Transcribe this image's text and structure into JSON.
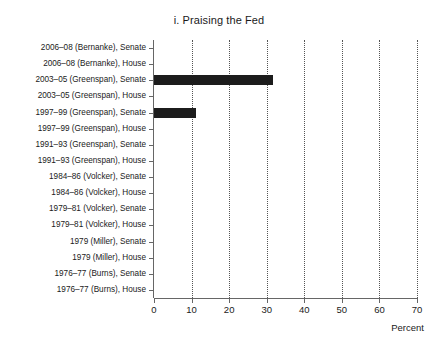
{
  "chart_data": {
    "type": "bar",
    "orientation": "horizontal",
    "title": "i. Praising the Fed",
    "xlabel": "Percent",
    "ylabel": "",
    "xlim": [
      0,
      70
    ],
    "xticks": [
      0,
      10,
      20,
      30,
      40,
      50,
      60,
      70
    ],
    "xtick_labels": [
      "0",
      "10",
      "20",
      "30",
      "40",
      "50",
      "60",
      "70"
    ],
    "grid": "vertical-dotted",
    "legend": "none",
    "bar_color": "#1c1c1c",
    "categories": [
      "2006–08 (Bernanke), Senate",
      "2006–08 (Bernanke), House",
      "2003–05 (Greenspan), Senate",
      "2003–05 (Greenspan), House",
      "1997–99 (Greenspan), Senate",
      "1997–99 (Greenspan), House",
      "1991–93 (Greenspan), Senate",
      "1991–93 (Greenspan), House",
      "1984–86 (Volcker), Senate",
      "1984–86 (Volcker), House",
      "1979–81 (Volcker), Senate",
      "1979–81 (Volcker), House",
      "1979 (Miller), Senate",
      "1979 (Miller), House",
      "1976–77 (Burns), Senate",
      "1976–77 (Burns), House"
    ],
    "values": [
      0,
      0,
      31.7,
      0,
      11.2,
      0,
      0,
      0,
      0,
      0,
      0,
      0,
      0,
      0,
      0,
      0
    ]
  }
}
